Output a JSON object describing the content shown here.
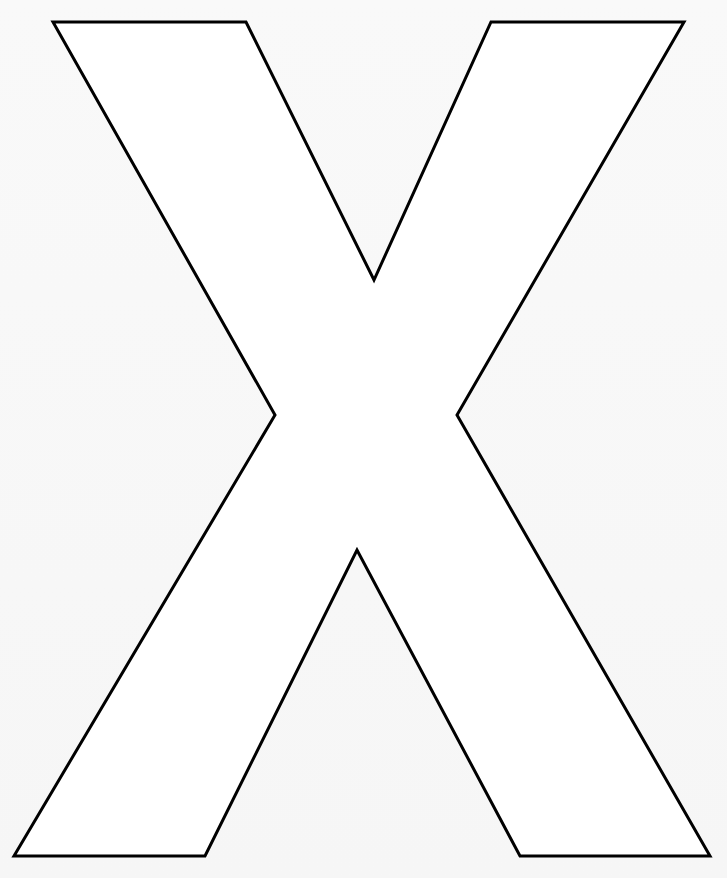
{
  "page": {
    "letter": "X",
    "background_color": "#f7f7f7",
    "fill_color": "#ffffff",
    "stroke_color": "#000000",
    "stroke_width": 3
  },
  "shape": {
    "points": [
      [
        53,
        22
      ],
      [
        246,
        22
      ],
      [
        374,
        280
      ],
      [
        491,
        22
      ],
      [
        684,
        22
      ],
      [
        457,
        415
      ],
      [
        710,
        856
      ],
      [
        520,
        856
      ],
      [
        357,
        550
      ],
      [
        205,
        856
      ],
      [
        14,
        856
      ],
      [
        275,
        415
      ]
    ]
  }
}
